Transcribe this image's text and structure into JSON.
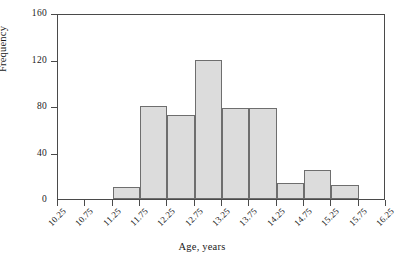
{
  "chart_data": {
    "type": "bar",
    "title": "",
    "xlabel": "Age, years",
    "ylabel": "Frequency",
    "bin_edges": [
      10.25,
      10.75,
      11.25,
      11.75,
      12.25,
      12.75,
      13.25,
      13.75,
      14.25,
      14.75,
      15.25,
      15.75,
      16.25
    ],
    "categories": [
      "10.25-10.75",
      "10.75-11.25",
      "11.25-11.75",
      "11.75-12.25",
      "12.25-12.75",
      "12.75-13.25",
      "13.25-13.75",
      "13.75-14.25",
      "14.25-14.75",
      "14.75-15.25",
      "15.25-15.75",
      "15.75-16.25"
    ],
    "values": [
      0,
      0,
      10,
      80,
      72,
      120,
      78,
      78,
      14,
      25,
      12,
      0
    ],
    "xtick_labels": [
      "10.25",
      "10.75",
      "11.25",
      "11.75",
      "12.25",
      "12.75",
      "13.25",
      "13.75",
      "14.25",
      "14.75",
      "15.25",
      "15.75",
      "16.25"
    ],
    "ytick_labels": [
      "0",
      "40",
      "80",
      "120",
      "160"
    ],
    "ytick_values": [
      0,
      40,
      80,
      120,
      160
    ],
    "ylim": [
      0,
      160
    ],
    "xlim": [
      10.25,
      16.25
    ],
    "grid": false,
    "legend": null,
    "bar_fill_color": "#dcdcdc",
    "bar_edge_color": "#6e6e6e",
    "axis_color": "#4a4a4a",
    "background_color": "#ffffff"
  }
}
